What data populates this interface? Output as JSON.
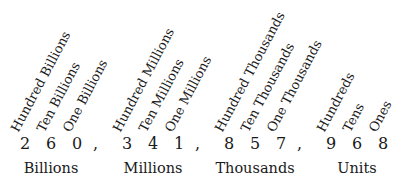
{
  "diagram": {
    "number": "260,341,857,968",
    "groups": [
      {
        "name": "Billions",
        "places": [
          {
            "label": "Hundred Billions",
            "digit": "2"
          },
          {
            "label": "Ten Billions",
            "digit": "6"
          },
          {
            "label": "One Billions",
            "digit": "0"
          }
        ],
        "separator": ","
      },
      {
        "name": "Millions",
        "places": [
          {
            "label": "Hundred Millions",
            "digit": "3"
          },
          {
            "label": "Ten Millions",
            "digit": "4"
          },
          {
            "label": "One Millions",
            "digit": "1"
          }
        ],
        "separator": ","
      },
      {
        "name": "Thousands",
        "places": [
          {
            "label": "Hundred Thousands",
            "digit": "8"
          },
          {
            "label": "Ten Thousands",
            "digit": "5"
          },
          {
            "label": "One Thousands",
            "digit": "7"
          }
        ],
        "separator": ","
      },
      {
        "name": "Units",
        "places": [
          {
            "label": "Hundreds",
            "digit": "9"
          },
          {
            "label": "Tens",
            "digit": "6"
          },
          {
            "label": "Ones",
            "digit": "8"
          }
        ]
      }
    ]
  }
}
